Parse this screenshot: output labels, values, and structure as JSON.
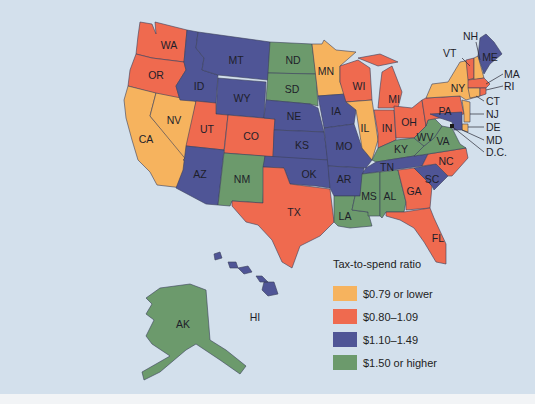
{
  "legend": {
    "title": "Tax-to-spend ratio",
    "items": [
      {
        "label": "$0.79 or lower",
        "color": "#f6b35e"
      },
      {
        "label": "$0.80–1.09",
        "color": "#ef6a4f"
      },
      {
        "label": "$1.10–1.49",
        "color": "#4f5596"
      },
      {
        "label": "$1.50 or higher",
        "color": "#6c9a6c"
      }
    ]
  },
  "colors": {
    "background": "#d3e0ec",
    "low": "#f6b35e",
    "midlow": "#ef6a4f",
    "midhigh": "#4f5596",
    "high": "#6c9a6c"
  },
  "states": {
    "WA": {
      "label": "WA",
      "category": "$0.80–1.09"
    },
    "OR": {
      "label": "OR",
      "category": "$0.80–1.09"
    },
    "CA": {
      "label": "CA",
      "category": "$0.79 or lower"
    },
    "NV": {
      "label": "NV",
      "category": "$0.79 or lower"
    },
    "ID": {
      "label": "ID",
      "category": "$1.10–1.49"
    },
    "MT": {
      "label": "MT",
      "category": "$1.10–1.49"
    },
    "WY": {
      "label": "WY",
      "category": "$1.10–1.49"
    },
    "UT": {
      "label": "UT",
      "category": "$0.80–1.09"
    },
    "CO": {
      "label": "CO",
      "category": "$0.80–1.09"
    },
    "AZ": {
      "label": "AZ",
      "category": "$1.10–1.49"
    },
    "NM": {
      "label": "NM",
      "category": "$1.50 or higher"
    },
    "ND": {
      "label": "ND",
      "category": "$1.50 or higher"
    },
    "SD": {
      "label": "SD",
      "category": "$1.50 or higher"
    },
    "NE": {
      "label": "NE",
      "category": "$1.10–1.49"
    },
    "KS": {
      "label": "KS",
      "category": "$1.10–1.49"
    },
    "OK": {
      "label": "OK",
      "category": "$1.10–1.49"
    },
    "TX": {
      "label": "TX",
      "category": "$0.80–1.09"
    },
    "MN": {
      "label": "MN",
      "category": "$0.79 or lower"
    },
    "IA": {
      "label": "IA",
      "category": "$1.10–1.49"
    },
    "MO": {
      "label": "MO",
      "category": "$1.10–1.49"
    },
    "AR": {
      "label": "AR",
      "category": "$1.10–1.49"
    },
    "LA": {
      "label": "LA",
      "category": "$1.50 or higher"
    },
    "WI": {
      "label": "WI",
      "category": "$0.80–1.09"
    },
    "IL": {
      "label": "IL",
      "category": "$0.79 or lower"
    },
    "MI": {
      "label": "MI",
      "category": "$0.80–1.09"
    },
    "IN": {
      "label": "IN",
      "category": "$0.80–1.09"
    },
    "OH": {
      "label": "OH",
      "category": "$0.80–1.09"
    },
    "KY": {
      "label": "KY",
      "category": "$1.50 or higher"
    },
    "TN": {
      "label": "TN",
      "category": "$1.10–1.49"
    },
    "MS": {
      "label": "MS",
      "category": "$1.50 or higher"
    },
    "AL": {
      "label": "AL",
      "category": "$1.50 or higher"
    },
    "GA": {
      "label": "GA",
      "category": "$0.80–1.09"
    },
    "FL": {
      "label": "FL",
      "category": "$0.80–1.09"
    },
    "SC": {
      "label": "SC",
      "category": "$1.10–1.49"
    },
    "NC": {
      "label": "NC",
      "category": "$0.80–1.09"
    },
    "VA": {
      "label": "VA",
      "category": "$1.50 or higher"
    },
    "WV": {
      "label": "WV",
      "category": "$1.50 or higher"
    },
    "PA": {
      "label": "PA",
      "category": "$0.80–1.09"
    },
    "NY": {
      "label": "NY",
      "category": "$0.79 or lower"
    },
    "NJ": {
      "label": "NJ",
      "category": "$0.79 or lower"
    },
    "DE": {
      "label": "DE",
      "category": "$0.79 or lower"
    },
    "MD": {
      "label": "MD",
      "category": "$1.10–1.49"
    },
    "DC": {
      "label": "D.C.",
      "category": "$1.50 or higher"
    },
    "CT": {
      "label": "CT",
      "category": "$0.79 or lower"
    },
    "RI": {
      "label": "RI",
      "category": "$0.80–1.09"
    },
    "MA": {
      "label": "MA",
      "category": "$0.80–1.09"
    },
    "VT": {
      "label": "VT",
      "category": "$0.80–1.09"
    },
    "NH": {
      "label": "NH",
      "category": "$0.79 or lower"
    },
    "ME": {
      "label": "ME",
      "category": "$1.10–1.49"
    },
    "AK": {
      "label": "AK",
      "category": "$1.50 or higher"
    },
    "HI": {
      "label": "HI",
      "category": "$1.10–1.49"
    }
  }
}
